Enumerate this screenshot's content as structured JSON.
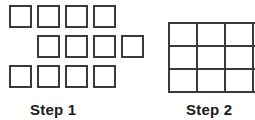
{
  "figure": {
    "background_color": "#ffffff",
    "outline_color": "#3a3a3a",
    "label_color": "#1b1b1b"
  },
  "steps": [
    {
      "id": "step1",
      "label": "Step 1",
      "arrangement": "separate-squares",
      "total_squares": 12,
      "rows": [
        {
          "name": "top-row",
          "count": 4,
          "offset": "none"
        },
        {
          "name": "middle-row",
          "count": 4,
          "offset": "right"
        },
        {
          "name": "bottom-row",
          "count": 4,
          "offset": "none"
        }
      ]
    },
    {
      "id": "step2",
      "label": "Step 2",
      "arrangement": "connected-grid",
      "columns": 4,
      "grid_rows": 3,
      "total_squares": 12,
      "note": "rightmost column cropped by image edge"
    }
  ]
}
